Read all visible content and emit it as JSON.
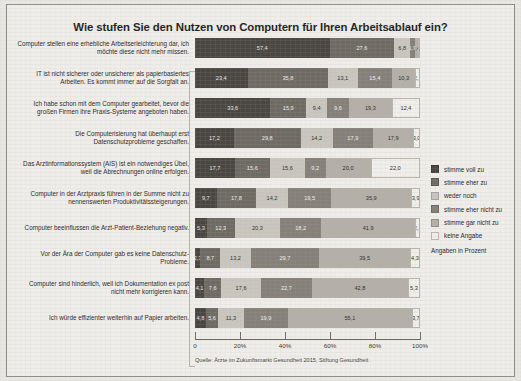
{
  "chart_data": {
    "type": "bar",
    "orientation": "horizontal",
    "stacked": true,
    "normalized_percent": true,
    "title": "Wie stufen Sie den Nutzen von Computern für Ihren Arbeitsablauf ein?",
    "xlabel": "",
    "ylabel": "",
    "xlim": [
      0,
      100
    ],
    "grid": false,
    "legend_position": "right",
    "xticks": [
      0,
      20,
      40,
      60,
      80,
      100
    ],
    "xtick_labels": [
      "0",
      "20%",
      "40%",
      "60%",
      "80%",
      "100%"
    ],
    "unit_note": "Angaben in Prozent",
    "source": "Quelle: Ärzte im Zukunftsmarkt Gesundheit 2015, Stiftung Gesundheit",
    "categories": [
      "Computer stellen eine erhebliche Arbeitserleichterung dar, ich möchte diese nicht mehr missen.",
      "IT ist nicht sicherer oder unsicherer als papierbasiertes Arbeiten. Es kommt immer auf die Sorgfalt an.",
      "Ich habe schon mit dem Computer gearbeitet, bevor die großen Firmen ihre Praxis-Systeme angeboten haben.",
      "Die Computerisierung hat überhaupt erst Datenschutzprobleme geschaffen.",
      "Das Arztinformationssystem (AIS) ist ein notwendiges Übel, weil die Abrechnungen online erfolgen.",
      "Computer in der Arztpraxis führen in der Summe nicht zu nennenswerten Produktivitätssteigerungen.",
      "Computer beeinflussen die Arzt-Patient-Beziehung negativ.",
      "Vor der Ära der Computer gab es keine Datenschutz-Probleme.",
      "Computer sind hinderlich, weil ich Dokumentation ex post nicht mehr korrigieren kann.",
      "Ich würde effizienter weiterhin auf Papier arbeiten."
    ],
    "series": [
      {
        "name": "stimme voll zu",
        "color": "#4a4742",
        "values": [
          57.4,
          23.4,
          33.6,
          17.2,
          17.7,
          9.7,
          5.3,
          2.3,
          4.1,
          4.8
        ]
      },
      {
        "name": "stimme eher zu",
        "color": "#6e6a64",
        "values": [
          27.6,
          35.8,
          15.9,
          29.8,
          15.6,
          17.8,
          12.3,
          8.7,
          7.6,
          5.6
        ]
      },
      {
        "name": "weder noch",
        "color": "#c9c6bf",
        "values": [
          6.8,
          13.1,
          9.4,
          14.2,
          15.6,
          14.2,
          20.3,
          13.2,
          17.6,
          11.3
        ]
      },
      {
        "name": "stimme eher nicht zu",
        "color": "#85817a",
        "values": [
          1.9,
          15.4,
          9.6,
          17.9,
          9.2,
          19.5,
          18.2,
          29.7,
          22.7,
          19.9
        ]
      },
      {
        "name": "stimme gar nicht zu",
        "color": "#b4b0a9",
        "values": [
          1.4,
          10.3,
          19.3,
          17.9,
          20.0,
          35.9,
          41.9,
          39.5,
          42.8,
          55.1
        ]
      },
      {
        "name": "keine Angabe",
        "color": "#efeeea",
        "values": [
          0.9,
          2.1,
          12.4,
          3.0,
          22.0,
          3.9,
          2.1,
          4.3,
          5.3,
          3.7
        ]
      }
    ],
    "value_labels": [
      [
        "57,4",
        "27,6",
        "6,8",
        "1,9",
        "1,4",
        "0,9"
      ],
      [
        "23,4",
        "35,8",
        "13,1",
        "15,4",
        "10,3",
        "2,1"
      ],
      [
        "33,6",
        "15,9",
        "9,4",
        "9,6",
        "19,3",
        "12,4"
      ],
      [
        "17,2",
        "29,8",
        "14,2",
        "17,9",
        "17,9",
        "3,0"
      ],
      [
        "17,7",
        "15,6",
        "15,6",
        "9,2",
        "20,0",
        "22,0"
      ],
      [
        "9,7",
        "17,8",
        "14,2",
        "19,5",
        "35,9",
        "3,9"
      ],
      [
        "5,3",
        "12,3",
        "20,3",
        "18,2",
        "41,9",
        "2,1"
      ],
      [
        "2,3",
        "8,7",
        "13,2",
        "29,7",
        "39,5",
        "4,3"
      ],
      [
        "4,1",
        "7,6",
        "17,6",
        "22,7",
        "42,8",
        "5,3"
      ],
      [
        "4,8",
        "5,6",
        "11,3",
        "19,9",
        "55,1",
        "3,7"
      ]
    ]
  }
}
